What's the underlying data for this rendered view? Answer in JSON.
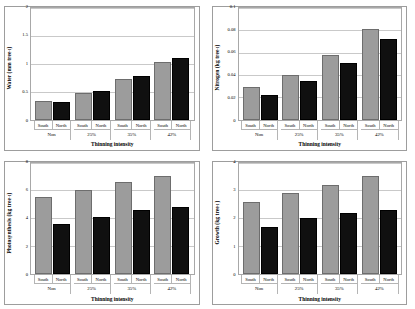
{
  "figure": {
    "colors": {
      "south_bar": "#9c9c9c",
      "north_bar": "#101010",
      "gridline": "#c9c9c9",
      "panel_border": "#9d9d9d",
      "background": "#ffffff"
    },
    "series_names": [
      "South",
      "North"
    ],
    "xlabel": "Thinning intensity",
    "categories": [
      "Non",
      "25%",
      "35%",
      "42%"
    ],
    "sides": [
      "South",
      "North"
    ]
  },
  "chart_data": [
    {
      "type": "bar",
      "title": "",
      "panel": "top-left",
      "xlabel": "Thinning intensity",
      "ylabel": "Water (mm tree-1)",
      "ylabel_base": "Water (mm tree",
      "ylabel_sup": "-1",
      "ylabel_tail": ")",
      "categories": [
        "Non",
        "25%",
        "35%",
        "42%"
      ],
      "sides": [
        "South",
        "North"
      ],
      "series": [
        {
          "name": "South",
          "values": [
            0.33,
            0.48,
            0.73,
            1.03
          ]
        },
        {
          "name": "North",
          "values": [
            0.31,
            0.51,
            0.78,
            1.11
          ]
        }
      ],
      "ylim": [
        0,
        2
      ],
      "yticks": [
        "0",
        "0.5",
        "1",
        "1.5",
        "2"
      ],
      "ytick_values": [
        0,
        0.5,
        1,
        1.5,
        2
      ],
      "grid": true
    },
    {
      "type": "bar",
      "title": "",
      "panel": "top-right",
      "xlabel": "Thinning intensity",
      "ylabel": "Nitrogen (kg tree-1)",
      "ylabel_base": "Nitrogen (kg tree",
      "ylabel_sup": "-1",
      "ylabel_tail": ")",
      "categories": [
        "Non",
        "25%",
        "35%",
        "42%"
      ],
      "sides": [
        "South",
        "North"
      ],
      "series": [
        {
          "name": "South",
          "values": [
            0.029,
            0.04,
            0.058,
            0.081
          ]
        },
        {
          "name": "North",
          "values": [
            0.022,
            0.035,
            0.051,
            0.072
          ]
        }
      ],
      "ylim": [
        0,
        0.1
      ],
      "yticks": [
        "0",
        "0.02",
        "0.04",
        "0.06",
        "0.08",
        "0.1"
      ],
      "ytick_values": [
        0,
        0.02,
        0.04,
        0.06,
        0.08,
        0.1
      ],
      "grid": true
    },
    {
      "type": "bar",
      "title": "",
      "panel": "bottom-left",
      "xlabel": "Thinning intensity",
      "ylabel": "Photosynthesis (kg tree-1)",
      "ylabel_base": "Photosynthesis (kg tree",
      "ylabel_sup": "-1",
      "ylabel_tail": ")",
      "categories": [
        "Non",
        "25%",
        "35%",
        "42%"
      ],
      "sides": [
        "South",
        "North"
      ],
      "series": [
        {
          "name": "South",
          "values": [
            5.5,
            6.0,
            6.6,
            7.0
          ]
        },
        {
          "name": "North",
          "values": [
            3.6,
            4.1,
            4.6,
            4.8
          ]
        }
      ],
      "ylim": [
        0,
        8
      ],
      "yticks": [
        "0",
        "2",
        "4",
        "6",
        "8"
      ],
      "ytick_values": [
        0,
        2,
        4,
        6,
        8
      ],
      "grid": true
    },
    {
      "type": "bar",
      "title": "",
      "panel": "bottom-right",
      "xlabel": "Thinning intensity",
      "ylabel": "Growth (kg tree-1)",
      "ylabel_base": "Growth (kg tree",
      "ylabel_sup": "-1",
      "ylabel_tail": ")",
      "categories": [
        "Non",
        "25%",
        "35%",
        "42%"
      ],
      "sides": [
        "South",
        "North"
      ],
      "series": [
        {
          "name": "South",
          "values": [
            2.6,
            2.9,
            3.2,
            3.5
          ]
        },
        {
          "name": "North",
          "values": [
            1.7,
            2.0,
            2.2,
            2.3
          ]
        }
      ],
      "ylim": [
        0,
        4
      ],
      "yticks": [
        "0",
        "1",
        "2",
        "3",
        "4"
      ],
      "ytick_values": [
        0,
        1,
        2,
        3,
        4
      ],
      "grid": true
    }
  ]
}
